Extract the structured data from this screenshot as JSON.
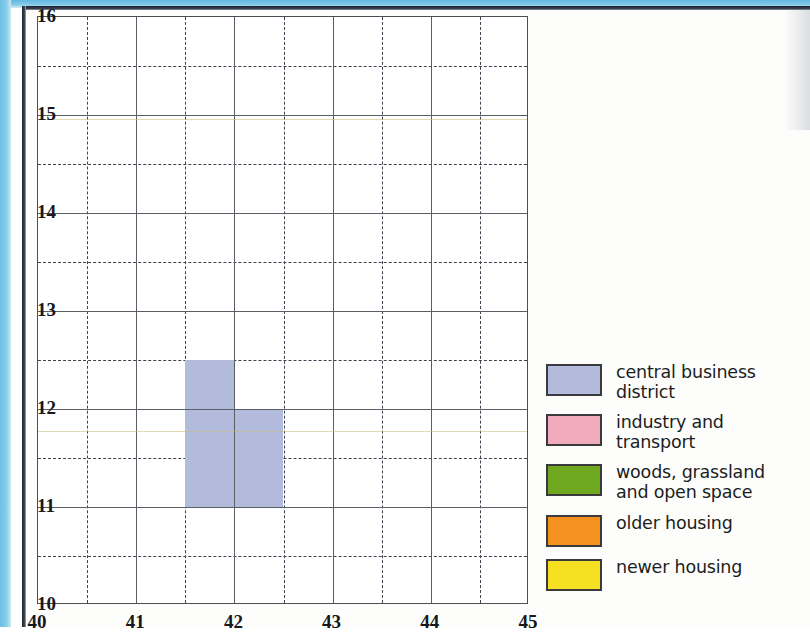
{
  "chart_data": {
    "type": "map",
    "title": "",
    "xlabel": "",
    "ylabel": "",
    "xlim": [
      40,
      45
    ],
    "ylim": [
      10,
      16
    ],
    "x_major_ticks": [
      "40",
      "41",
      "42",
      "43",
      "44",
      "45"
    ],
    "y_major_ticks": [
      "10",
      "11",
      "12",
      "13",
      "14",
      "15",
      "16"
    ],
    "x_minor_ticks": [
      "40.5",
      "41.5",
      "42.5",
      "43.5",
      "44.5"
    ],
    "y_minor_ticks": [
      "10.5",
      "11.5",
      "12.5",
      "13.5",
      "14.5",
      "15.5"
    ],
    "grid": true,
    "grid_major_style": "solid",
    "grid_minor_style": "dashed",
    "legend_position": "right",
    "regions": [
      {
        "category": "central business district",
        "color": "#b3bbdc",
        "cells": [
          {
            "x0": 41.5,
            "x1": 42.0,
            "y0": 11.0,
            "y1": 12.5
          },
          {
            "x0": 42.0,
            "x1": 42.5,
            "y0": 11.0,
            "y1": 12.0
          }
        ]
      }
    ]
  },
  "axes": {
    "x_ticks": [
      {
        "value": 40,
        "label": "40"
      },
      {
        "value": 41,
        "label": "41"
      },
      {
        "value": 42,
        "label": "42"
      },
      {
        "value": 43,
        "label": "43"
      },
      {
        "value": 44,
        "label": "44"
      },
      {
        "value": 45,
        "label": "45"
      }
    ],
    "y_ticks": [
      {
        "value": 10,
        "label": "10"
      },
      {
        "value": 11,
        "label": "11"
      },
      {
        "value": 12,
        "label": "12"
      },
      {
        "value": 13,
        "label": "13"
      },
      {
        "value": 14,
        "label": "14"
      },
      {
        "value": 15,
        "label": "15"
      },
      {
        "value": 16,
        "label": "16"
      }
    ]
  },
  "legend": {
    "items": [
      {
        "label": "central business\ndistrict",
        "color": "#b3bbdc",
        "swatch_name": "legend-swatch-central-business-district"
      },
      {
        "label": "industry and transport",
        "color": "#f2aabd",
        "swatch_name": "legend-swatch-industry-and-transport"
      },
      {
        "label": "woods, grassland\nand open space",
        "color": "#6da81e",
        "swatch_name": "legend-swatch-woods-grassland-open-space"
      },
      {
        "label": "older housing",
        "color": "#f59120",
        "swatch_name": "legend-swatch-older-housing"
      },
      {
        "label": "newer housing",
        "color": "#f5e121",
        "swatch_name": "legend-swatch-newer-housing"
      }
    ]
  },
  "colors": {
    "page_edge_blue": "#7ec5e8",
    "grid_line": "#5a5f66",
    "grid_dash": "#3d4350",
    "frame": "#4a4f57",
    "text": "#16181c"
  }
}
